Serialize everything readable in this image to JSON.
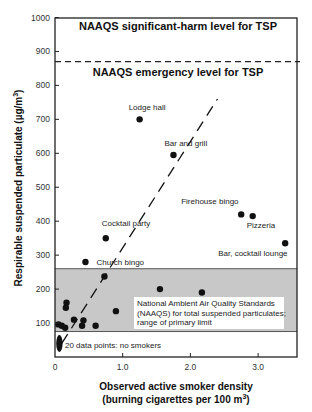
{
  "chart_data": {
    "type": "scatter",
    "title": "",
    "xlabel": "Observed active smoker density (burning cigarettes per 100 m³)",
    "xlabel_lines": [
      "Observed active smoker density",
      "(burning cigarettes per 100 m",
      "3",
      ")"
    ],
    "ylabel": "Respirable suspended particulate (µg/m³)",
    "ylabel_main": "Respirable suspended particulate (µg/m",
    "ylabel_sup": "3",
    "ylabel_end": ")",
    "xlim": [
      0,
      3.55
    ],
    "ylim": [
      0,
      1000
    ],
    "x_ticks": [
      0,
      1.0,
      2.0,
      3.0
    ],
    "x_tick_labels": [
      "0",
      "1.0",
      "2.0",
      "3.0"
    ],
    "y_ticks": [
      100,
      200,
      300,
      400,
      500,
      600,
      700,
      800,
      900,
      1000
    ],
    "y_tick_labels": [
      "100",
      "200",
      "300",
      "400",
      "500",
      "600",
      "700",
      "800",
      "900",
      "1000"
    ],
    "grid": false,
    "legend": null,
    "reference_lines": [
      {
        "type": "hline",
        "y": 870,
        "style": "dashed",
        "label_above": "NAAQS significant-harm level for TSP",
        "label_below": "NAAQS emergency level for TSP"
      }
    ],
    "band": {
      "y_from": 75,
      "y_to": 260,
      "color": "#c8c8c8",
      "label_lines": [
        "National Ambient Air Quality Standards",
        "(NAAQS) for total suspended particulates;",
        "range of primary limit"
      ]
    },
    "regression_line": {
      "style": "dashed",
      "from": [
        0.1,
        40
      ],
      "to": [
        2.4,
        760
      ]
    },
    "no_smokers_cluster": {
      "x": 0.05,
      "y_from": 15,
      "y_to": 65,
      "count": 20,
      "label": "20 data points: no smokers"
    },
    "points": [
      {
        "x": 1.25,
        "y": 700,
        "label": "Lodge hall"
      },
      {
        "x": 1.75,
        "y": 595,
        "label": "Bar and grill"
      },
      {
        "x": 2.75,
        "y": 420,
        "label": "Firehouse bingo"
      },
      {
        "x": 2.92,
        "y": 415,
        "label": "Pizzeria"
      },
      {
        "x": 3.4,
        "y": 335,
        "label": "Bar, cocktail lounge"
      },
      {
        "x": 0.75,
        "y": 350,
        "label": "Cocktail party"
      },
      {
        "x": 0.45,
        "y": 280,
        "label": "Church bingo"
      },
      {
        "x": 0.73,
        "y": 237,
        "label": ""
      },
      {
        "x": 1.55,
        "y": 200,
        "label": ""
      },
      {
        "x": 2.17,
        "y": 190,
        "label": ""
      },
      {
        "x": 0.17,
        "y": 160,
        "label": ""
      },
      {
        "x": 0.16,
        "y": 145,
        "label": ""
      },
      {
        "x": 0.9,
        "y": 135,
        "label": ""
      },
      {
        "x": 0.28,
        "y": 110,
        "label": ""
      },
      {
        "x": 0.42,
        "y": 108,
        "label": ""
      },
      {
        "x": 0.4,
        "y": 92,
        "label": ""
      },
      {
        "x": 0.6,
        "y": 92,
        "label": ""
      },
      {
        "x": 0.05,
        "y": 96,
        "label": ""
      },
      {
        "x": 0.1,
        "y": 92,
        "label": ""
      },
      {
        "x": 0.15,
        "y": 86,
        "label": ""
      }
    ]
  }
}
